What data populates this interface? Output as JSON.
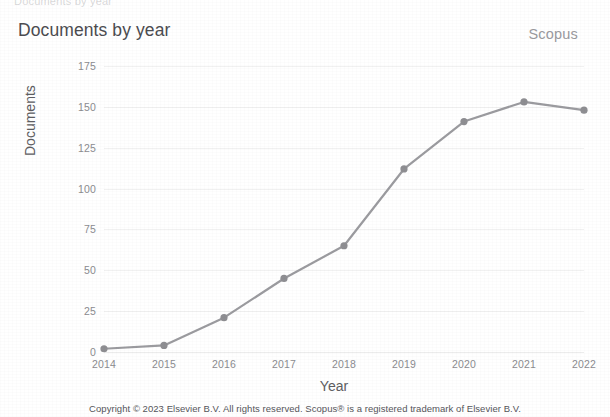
{
  "header": {
    "clipped_top_text": "Documents by year",
    "title": "Documents by year",
    "brand": "Scopus"
  },
  "footer": {
    "copyright": "Copyright © 2023 Elsevier B.V. All rights reserved. Scopus® is a registered trademark of Elsevier B.V."
  },
  "colors": {
    "line": "#9b9b9f",
    "marker": "#8e8e92",
    "grid": "#e8e8ea",
    "text": "#8b8b8f",
    "title": "#4c4c50",
    "brand": "#9a9a9e"
  },
  "chart_data": {
    "type": "line",
    "title": "Documents by year",
    "xlabel": "Year",
    "ylabel": "Documents",
    "categories": [
      "2014",
      "2015",
      "2016",
      "2017",
      "2018",
      "2019",
      "2020",
      "2021",
      "2022"
    ],
    "values": [
      2,
      4,
      21,
      45,
      65,
      112,
      141,
      153,
      148
    ],
    "x": [
      2014,
      2015,
      2016,
      2017,
      2018,
      2019,
      2020,
      2021,
      2022
    ],
    "ylim": [
      0,
      175
    ],
    "yticks": [
      0,
      25,
      50,
      75,
      100,
      125,
      150,
      175
    ],
    "ytick_labels": [
      "0",
      "25",
      "50",
      "75",
      "100",
      "125",
      "150",
      "175"
    ],
    "xtick_labels": [
      "2014",
      "2015",
      "2016",
      "2017",
      "2018",
      "2019",
      "2020",
      "2021",
      "2022"
    ],
    "grid": "horizontal",
    "legend": "none",
    "series": [
      {
        "name": "Documents",
        "values": [
          2,
          4,
          21,
          45,
          65,
          112,
          141,
          153,
          148
        ]
      }
    ]
  }
}
